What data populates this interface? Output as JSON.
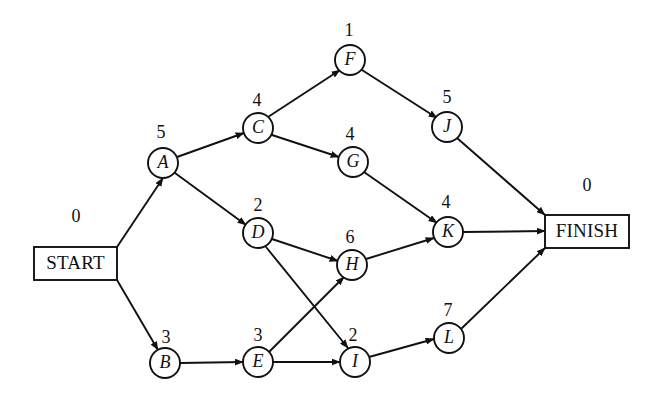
{
  "diagram": {
    "type": "activity-on-node-network",
    "canvas": {
      "width": 657,
      "height": 401
    },
    "colors": {
      "stroke": "#111111",
      "background": "#ffffff"
    },
    "terminals": [
      {
        "id": "START",
        "label": "START",
        "duration": "0",
        "box": {
          "x": 34,
          "y": 247,
          "width": 83,
          "height": 33
        },
        "duration_pos": {
          "x": 76,
          "y": 218
        }
      },
      {
        "id": "FINISH",
        "label": "FINISH",
        "duration": "0",
        "box": {
          "x": 545,
          "y": 215,
          "width": 84,
          "height": 33
        },
        "duration_pos": {
          "x": 587,
          "y": 187
        }
      }
    ],
    "nodes": [
      {
        "id": "A",
        "label": "A",
        "duration": "5",
        "cx": 163,
        "cy": 163,
        "r": 15,
        "duration_pos": {
          "x": 161,
          "y": 134
        }
      },
      {
        "id": "B",
        "label": "B",
        "duration": "3",
        "cx": 165,
        "cy": 363,
        "r": 15,
        "duration_pos": {
          "x": 166,
          "y": 339
        }
      },
      {
        "id": "C",
        "label": "C",
        "duration": "4",
        "cx": 258,
        "cy": 128,
        "r": 15,
        "duration_pos": {
          "x": 257,
          "y": 102
        }
      },
      {
        "id": "D",
        "label": "D",
        "duration": "2",
        "cx": 258,
        "cy": 233,
        "r": 15,
        "duration_pos": {
          "x": 258,
          "y": 207
        }
      },
      {
        "id": "E",
        "label": "E",
        "duration": "3",
        "cx": 258,
        "cy": 362,
        "r": 15,
        "duration_pos": {
          "x": 258,
          "y": 337
        }
      },
      {
        "id": "F",
        "label": "F",
        "duration": "1",
        "cx": 350,
        "cy": 60,
        "r": 15,
        "duration_pos": {
          "x": 349,
          "y": 32
        }
      },
      {
        "id": "G",
        "label": "G",
        "duration": "4",
        "cx": 353,
        "cy": 162,
        "r": 15,
        "duration_pos": {
          "x": 350,
          "y": 136
        }
      },
      {
        "id": "H",
        "label": "H",
        "duration": "6",
        "cx": 352,
        "cy": 265,
        "r": 15,
        "duration_pos": {
          "x": 350,
          "y": 239
        }
      },
      {
        "id": "I",
        "label": "I",
        "duration": "2",
        "cx": 355,
        "cy": 362,
        "r": 15,
        "duration_pos": {
          "x": 353,
          "y": 337
        }
      },
      {
        "id": "J",
        "label": "J",
        "duration": "5",
        "cx": 447,
        "cy": 127,
        "r": 15,
        "duration_pos": {
          "x": 447,
          "y": 99
        }
      },
      {
        "id": "K",
        "label": "K",
        "duration": "4",
        "cx": 448,
        "cy": 232,
        "r": 15,
        "duration_pos": {
          "x": 446,
          "y": 204
        }
      },
      {
        "id": "L",
        "label": "L",
        "duration": "7",
        "cx": 449,
        "cy": 338,
        "r": 15,
        "duration_pos": {
          "x": 448,
          "y": 312
        }
      }
    ],
    "edges": [
      {
        "from": "START",
        "to": "A",
        "x1": 117,
        "y1": 247,
        "x2": 163,
        "y2": 178
      },
      {
        "from": "START",
        "to": "B",
        "x1": 117,
        "y1": 280,
        "x2": 158,
        "y2": 350
      },
      {
        "from": "A",
        "to": "C",
        "x1": 177,
        "y1": 157,
        "x2": 244,
        "y2": 133
      },
      {
        "from": "A",
        "to": "D",
        "x1": 175,
        "y1": 173,
        "x2": 246,
        "y2": 225
      },
      {
        "from": "B",
        "to": "E",
        "x1": 180,
        "y1": 363,
        "x2": 243,
        "y2": 362
      },
      {
        "from": "C",
        "to": "F",
        "x1": 268,
        "y1": 117,
        "x2": 340,
        "y2": 70
      },
      {
        "from": "C",
        "to": "G",
        "x1": 272,
        "y1": 135,
        "x2": 339,
        "y2": 157
      },
      {
        "from": "D",
        "to": "H",
        "x1": 272,
        "y1": 239,
        "x2": 338,
        "y2": 261
      },
      {
        "from": "D",
        "to": "I",
        "x1": 266,
        "y1": 247,
        "x2": 348,
        "y2": 348
      },
      {
        "from": "E",
        "to": "H",
        "x1": 269,
        "y1": 352,
        "x2": 344,
        "y2": 277
      },
      {
        "from": "E",
        "to": "I",
        "x1": 273,
        "y1": 362,
        "x2": 340,
        "y2": 362
      },
      {
        "from": "F",
        "to": "J",
        "x1": 362,
        "y1": 70,
        "x2": 437,
        "y2": 118
      },
      {
        "from": "G",
        "to": "K",
        "x1": 364,
        "y1": 172,
        "x2": 437,
        "y2": 223
      },
      {
        "from": "H",
        "to": "K",
        "x1": 366,
        "y1": 259,
        "x2": 434,
        "y2": 238
      },
      {
        "from": "I",
        "to": "L",
        "x1": 369,
        "y1": 357,
        "x2": 434,
        "y2": 339
      },
      {
        "from": "J",
        "to": "FINISH",
        "x1": 457,
        "y1": 138,
        "x2": 545,
        "y2": 215
      },
      {
        "from": "K",
        "to": "FINISH",
        "x1": 463,
        "y1": 232,
        "x2": 545,
        "y2": 231
      },
      {
        "from": "L",
        "to": "FINISH",
        "x1": 461,
        "y1": 329,
        "x2": 545,
        "y2": 248
      }
    ]
  }
}
